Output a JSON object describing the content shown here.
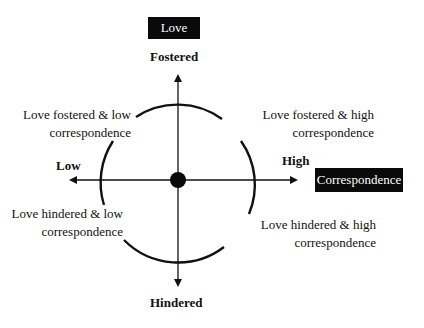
{
  "diagram": {
    "vertical_axis": {
      "name": "Love",
      "top_label": "Fostered",
      "bottom_label": "Hindered"
    },
    "horizontal_axis": {
      "name": "Correspondence",
      "left_label": "Low",
      "right_label": "High"
    },
    "quadrants": {
      "top_left": {
        "line1": "Love fostered & low",
        "line2": "correspondence"
      },
      "top_right": {
        "line1": "Love fostered & high",
        "line2": "correspondence"
      },
      "bottom_left": {
        "line1": "Love hindered & low",
        "line2": "correspondence"
      },
      "bottom_right": {
        "line1": "Love hindered & high",
        "line2": "correspondence"
      }
    },
    "colors": {
      "ink": "#111111",
      "box": "#0a0a0a",
      "box_text": "#ffffff",
      "background": "#ffffff"
    }
  }
}
